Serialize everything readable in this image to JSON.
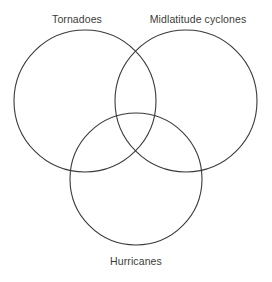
{
  "figure": {
    "type": "venn-diagram",
    "set_count": 3,
    "background_color": "#ffffff",
    "stroke_color": "#3a3a3a",
    "stroke_width": 1.1,
    "label_color": "#3b3b3b"
  },
  "sets": [
    {
      "key": "tornadoes",
      "label": "Tornadoes",
      "icon": "circle-outline-icon",
      "cx": 85,
      "cy": 101,
      "r": 71,
      "label_x": 77,
      "label_y": 13
    },
    {
      "key": "midlatitude_cyclones",
      "label": "Midlatitude cyclones",
      "icon": "circle-outline-icon",
      "cx": 186,
      "cy": 101,
      "r": 71,
      "label_x": 198,
      "label_y": 13
    },
    {
      "key": "hurricanes",
      "label": "Hurricanes",
      "icon": "circle-outline-icon",
      "cx": 136,
      "cy": 179,
      "r": 66,
      "label_x": 136,
      "label_y": 255
    }
  ],
  "regions": {
    "tornadoes_only": "",
    "midlatitude_cyclones_only": "",
    "hurricanes_only": "",
    "tornadoes_midlatitude_cyclones": "",
    "tornadoes_hurricanes": "",
    "midlatitude_cyclones_hurricanes": "",
    "all_three": ""
  }
}
